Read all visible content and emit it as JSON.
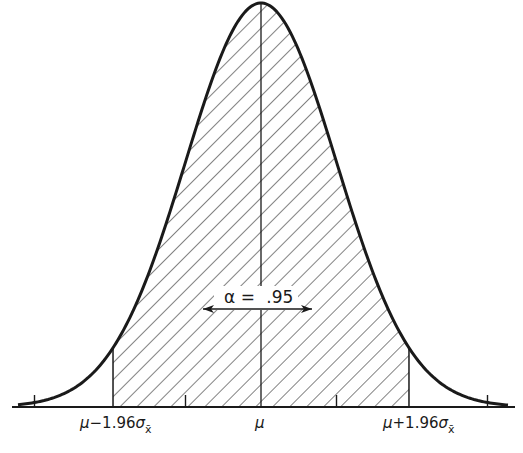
{
  "diagram": {
    "type": "normal-distribution",
    "colors": {
      "ink": "#1a1a1a",
      "background": "#ffffff"
    },
    "curve": {
      "center_x": 261,
      "peak_y": 3,
      "baseline_y": 407,
      "sigma_px": 75.5
    },
    "shaded_region": {
      "from_z": -1.96,
      "to_z": 1.96,
      "pattern": "diagonal-hatch"
    },
    "annotation": {
      "symbol": "α",
      "equals": "=",
      "value": ".95"
    },
    "axis_labels": {
      "left": {
        "mu": "μ",
        "op": "−1.96",
        "sigma": "σ",
        "sub": "x̄"
      },
      "center": "μ",
      "right": {
        "mu": "μ",
        "op": "+1.96",
        "sigma": "σ",
        "sub": "x̄"
      }
    },
    "ticks_z": [
      -3,
      -1.96,
      -1,
      0,
      1,
      1.96,
      3
    ]
  }
}
